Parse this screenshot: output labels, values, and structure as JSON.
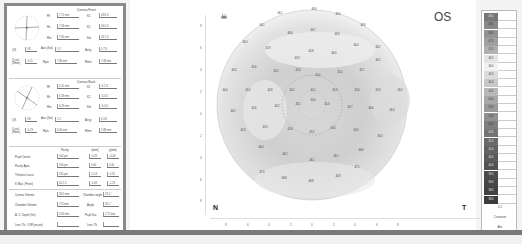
{
  "eye": "OS",
  "orientation": {
    "left": "N",
    "right": "T"
  },
  "left_panel": {
    "front": {
      "title": "Cornea Front",
      "rows": [
        {
          "label": "Rf",
          "value": "7.71 mm",
          "label2": "K1",
          "value2": "43.8 D"
        },
        {
          "label": "Rs",
          "value": "7.58 mm",
          "label2": "K2",
          "value2": "44.5 D"
        },
        {
          "label": "Rm",
          "value": "7.65 mm",
          "label2": "Km",
          "value2": "44.1 D"
        }
      ],
      "qs_label": "QS",
      "qs_value": "OK",
      "axis_label": "Axis (flat)",
      "axis_value": "5.1 °",
      "astig_label": "Astig",
      "astig_value": "0.7 D",
      "q_val_label": "Q-val. (8mm)",
      "q_val_value": "-0.11",
      "rper_label": "Rper",
      "rper_value": "7.86 mm",
      "rmin_label": "Rmin",
      "rmin_value": "7.48 mm"
    },
    "back": {
      "title": "Cornea Back",
      "rows": [
        {
          "label": "Rf",
          "value": "6.41 mm",
          "label2": "K1",
          "value2": "-6.2 D"
        },
        {
          "label": "Rs",
          "value": "6.18 mm",
          "label2": "K2",
          "value2": "-6.5 D"
        },
        {
          "label": "Rm",
          "value": "6.29 mm",
          "label2": "Km",
          "value2": "-6.4 D"
        }
      ],
      "qs_label": "QS",
      "qs_value": "OK",
      "axis_label": "Axis (flat)",
      "axis_value": "1.1 °",
      "astig_label": "Astig",
      "astig_value": "0.3 D",
      "q_val_label": "Q-val. (8mm)",
      "q_val_value": "-0.19",
      "rper_label": "Rper",
      "rper_value": "6.45 mm",
      "rmin_label": "Rmin",
      "rmin_value": "5.88 mm"
    },
    "pachy": {
      "col_headers": [
        "Pachy",
        "x[mm]",
        "y[mm]"
      ],
      "rows": [
        {
          "label": "Pupil Center",
          "value": "540 µm",
          "x": "-0.09",
          "y": "+0.06"
        },
        {
          "label": "Pachy Apex",
          "value": "540 µm",
          "x": "0.00",
          "y": "0.00"
        },
        {
          "label": "Thinnest Locat.",
          "value": "535 µm",
          "x": "-0.13",
          "y": "-0.32"
        },
        {
          "label": "K Max. (Front)",
          "value": "45.1 D",
          "x": "-0.48",
          "y": "-1.19"
        }
      ],
      "extra": [
        {
          "label": "Cornea Volume",
          "value": "58.5 mm³",
          "label2": "Chamber angle",
          "value2": "37.4 °"
        },
        {
          "label": "Chamber Volume",
          "value": "173 mm³",
          "label2": "Angle",
          "value2": "35.1 °"
        },
        {
          "label": "A. C. Depth (Int.)",
          "value": "3.03 mm",
          "label2": "Pupil Dia",
          "value2": "2.71 mm"
        },
        {
          "label": "Lens Th.",
          "value": "",
          "label2": "Lens Th.",
          "value2": ""
        }
      ],
      "extra_labels_override": [
        "Cornea Volume",
        "Chamber Volume",
        "A. C. Depth (Int.)",
        "Lens Th. / IOP(uncorr)"
      ]
    }
  },
  "map": {
    "y_ticks": [
      "8",
      "6",
      "4",
      "2",
      "0",
      "2",
      "4",
      "6",
      "8"
    ],
    "x_ticks": [
      "8",
      "6",
      "4",
      "2",
      "0",
      "2",
      "4",
      "6",
      "8"
    ],
    "values": [
      {
        "x": 280,
        "y": 13,
        "v": "46.1"
      },
      {
        "x": 314,
        "y": 9,
        "v": "46.9"
      },
      {
        "x": 338,
        "y": 14,
        "v": "46.4"
      },
      {
        "x": 262,
        "y": 25,
        "v": "46.5"
      },
      {
        "x": 290,
        "y": 33,
        "v": "46.6"
      },
      {
        "x": 313,
        "y": 30,
        "v": "46.7"
      },
      {
        "x": 337,
        "y": 34,
        "v": "46.3"
      },
      {
        "x": 363,
        "y": 25,
        "v": "46.8"
      },
      {
        "x": 245,
        "y": 42,
        "v": "46.0"
      },
      {
        "x": 268,
        "y": 48,
        "v": "45.9"
      },
      {
        "x": 311,
        "y": 51,
        "v": "45.8"
      },
      {
        "x": 334,
        "y": 53,
        "v": "46.0"
      },
      {
        "x": 356,
        "y": 45,
        "v": "46.4"
      },
      {
        "x": 378,
        "y": 47,
        "v": "46.2"
      },
      {
        "x": 297,
        "y": 58,
        "v": "45.9"
      },
      {
        "x": 234,
        "y": 70,
        "v": "46.3"
      },
      {
        "x": 254,
        "y": 67,
        "v": "45.6"
      },
      {
        "x": 276,
        "y": 71,
        "v": "45.5"
      },
      {
        "x": 298,
        "y": 70,
        "v": "45.3"
      },
      {
        "x": 318,
        "y": 75,
        "v": "45.4"
      },
      {
        "x": 340,
        "y": 72,
        "v": "45.5"
      },
      {
        "x": 362,
        "y": 70,
        "v": "45.7"
      },
      {
        "x": 378,
        "y": 60,
        "v": "46.1"
      },
      {
        "x": 225,
        "y": 90,
        "v": "46.4"
      },
      {
        "x": 248,
        "y": 90,
        "v": "45.4"
      },
      {
        "x": 270,
        "y": 90,
        "v": "44.9"
      },
      {
        "x": 292,
        "y": 90,
        "v": "45.2"
      },
      {
        "x": 313,
        "y": 90,
        "v": "45.1"
      },
      {
        "x": 335,
        "y": 90,
        "v": "45.3"
      },
      {
        "x": 357,
        "y": 90,
        "v": "45.6"
      },
      {
        "x": 378,
        "y": 90,
        "v": "45.9"
      },
      {
        "x": 400,
        "y": 90,
        "v": "46.4"
      },
      {
        "x": 233,
        "y": 111,
        "v": "46.2"
      },
      {
        "x": 254,
        "y": 108,
        "v": "45.6"
      },
      {
        "x": 277,
        "y": 106,
        "v": "45.2"
      },
      {
        "x": 298,
        "y": 104,
        "v": "45.1"
      },
      {
        "x": 313,
        "y": 100,
        "v": "45.0"
      },
      {
        "x": 327,
        "y": 104,
        "v": "45.3"
      },
      {
        "x": 350,
        "y": 107,
        "v": "45.7"
      },
      {
        "x": 371,
        "y": 108,
        "v": "46.0"
      },
      {
        "x": 392,
        "y": 110,
        "v": "46.3"
      },
      {
        "x": 243,
        "y": 130,
        "v": "46.3"
      },
      {
        "x": 265,
        "y": 127,
        "v": "45.9"
      },
      {
        "x": 290,
        "y": 129,
        "v": "45.6"
      },
      {
        "x": 312,
        "y": 132,
        "v": "45.5"
      },
      {
        "x": 333,
        "y": 128,
        "v": "45.6"
      },
      {
        "x": 356,
        "y": 130,
        "v": "45.9"
      },
      {
        "x": 380,
        "y": 136,
        "v": "46.5"
      },
      {
        "x": 261,
        "y": 147,
        "v": "46.4"
      },
      {
        "x": 285,
        "y": 154,
        "v": "46.2"
      },
      {
        "x": 312,
        "y": 160,
        "v": "46.1"
      },
      {
        "x": 336,
        "y": 156,
        "v": "46.1"
      },
      {
        "x": 361,
        "y": 150,
        "v": "46.6"
      },
      {
        "x": 262,
        "y": 172,
        "v": "47.0"
      },
      {
        "x": 284,
        "y": 178,
        "v": "46.8"
      },
      {
        "x": 311,
        "y": 181,
        "v": "46.8"
      },
      {
        "x": 338,
        "y": 176,
        "v": "46.9"
      },
      {
        "x": 357,
        "y": 167,
        "v": "47.1"
      }
    ]
  },
  "scale": {
    "steps": [
      "49.0",
      "48.5",
      "48.0",
      "47.5",
      "47.0",
      "46.5",
      "46.0",
      "45.5",
      "45.0",
      "44.5",
      "44.0",
      "43.5",
      "43.0",
      "42.5",
      "42.0",
      "41.5",
      "41.0",
      "40.5",
      "40.0",
      "39.5",
      "39.0",
      "38.5",
      "38.0"
    ],
    "colors": [
      "#777",
      "#888",
      "#939393",
      "#a0a0a0",
      "#b0b0b0",
      "#e4e4e4",
      "#f2f2f2",
      "#dcdcdc",
      "#c8c8c8",
      "#b8b8b8",
      "#a8a8a8",
      "#999",
      "#909090",
      "#7e7e7e",
      "#747474",
      "#6a6a6a",
      "#626262",
      "#5a5a5a",
      "#525252",
      "#4c4c4c",
      "#464646",
      "#424242",
      "#3c3c3c"
    ],
    "step_size": "0.5",
    "mode": "Curvature",
    "abs_label": "Abs"
  }
}
